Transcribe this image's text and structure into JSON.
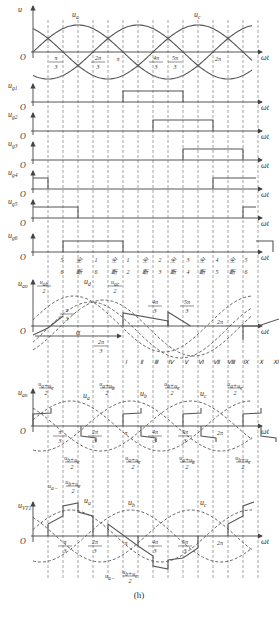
{
  "figure": {
    "caption": "(h)",
    "x_axis_label": "ωt",
    "origin_label": "O",
    "geometry": {
      "x0": 33,
      "x_end": 258,
      "px_per_pi6": 15,
      "amp": 27
    }
  },
  "vertical_dashed_lines_pi6_multiples": [
    1,
    2,
    3,
    4,
    5,
    6,
    7,
    8,
    9,
    10,
    11,
    12,
    13,
    14,
    15
  ],
  "panels": [
    {
      "id": "phase-voltages",
      "y_label": "u",
      "axis_y": 52,
      "curves": [
        {
          "name": "u_a",
          "phase_deg": 0,
          "style": "solid",
          "label": "u_a",
          "label_x": 72,
          "label_y": 17
        },
        {
          "name": "u_b",
          "phase_deg": -120,
          "style": "solid"
        },
        {
          "name": "u_c",
          "phase_deg": 120,
          "style": "solid",
          "label": "u_c",
          "label_x": 194,
          "label_y": 17
        }
      ],
      "tick_labels": [
        {
          "text_num": "π",
          "text_den": "3",
          "x": 56
        },
        {
          "text_num": "2π",
          "text_den": "3",
          "x": 98
        },
        {
          "text": "π",
          "x": 118
        },
        {
          "text_num": "4π",
          "text_den": "3",
          "x": 156
        },
        {
          "text_num": "5π",
          "text_den": "3",
          "x": 175
        },
        {
          "text": "2π",
          "x": 218
        }
      ]
    }
  ],
  "gate_pulses": [
    {
      "label": "u_g1",
      "axis_y": 102,
      "segments": [
        [
          6,
          10
        ]
      ]
    },
    {
      "label": "u_g2",
      "axis_y": 131,
      "segments": [
        [
          8,
          12
        ]
      ]
    },
    {
      "label": "u_g3",
      "axis_y": 160,
      "segments": [
        [
          10,
          14
        ]
      ]
    },
    {
      "label": "u_g4",
      "axis_y": 189,
      "segments": [
        [
          0,
          1
        ],
        [
          12,
          16
        ]
      ]
    },
    {
      "label": "u_g5",
      "axis_y": 218,
      "segments": [
        [
          0,
          3
        ],
        [
          14,
          17
        ]
      ]
    },
    {
      "label": "u_g6",
      "axis_y": 252,
      "segments": [
        [
          2,
          6
        ],
        [
          16,
          17
        ]
      ]
    }
  ],
  "conduction_row": {
    "y": 262,
    "items": [
      {
        "top": "5",
        "bottom": "6",
        "x": 62
      },
      {
        "top": "全",
        "bottom": "断",
        "x": 79
      },
      {
        "top": "1",
        "bottom": "6",
        "x": 96
      },
      {
        "top": "全",
        "bottom": "断",
        "x": 114
      },
      {
        "top": "1",
        "bottom": "2",
        "x": 128
      },
      {
        "top": "全",
        "bottom": "断",
        "x": 145
      },
      {
        "top": "2",
        "bottom": "3",
        "x": 160
      },
      {
        "top": "全",
        "bottom": "断",
        "x": 173
      },
      {
        "top": "3",
        "bottom": "4",
        "x": 188
      },
      {
        "top": "全",
        "bottom": "断",
        "x": 202
      },
      {
        "top": "4",
        "bottom": "5",
        "x": 217
      },
      {
        "top": "全",
        "bottom": "断",
        "x": 232
      },
      {
        "top": "5",
        "bottom": "6",
        "x": 246
      }
    ]
  },
  "uao_panel": {
    "y_label": "u_ao",
    "axis_y": 326,
    "labels": {
      "uab_half_num": "u_ab",
      "uab_half_den": "2",
      "ud": "u_d",
      "uac_half_num": "u_ac",
      "uac_half_den": "2",
      "alpha": "α",
      "pi3_num": "π",
      "pi3_den": "3",
      "two_pi3_num": "2π",
      "two_pi3_den": "3",
      "four_pi3_num": "4π",
      "four_pi3_den": "3",
      "five_pi3_num": "5π",
      "five_pi3_den": "3",
      "two_pi": "2π"
    },
    "intervals": [
      "Ⅰ",
      "Ⅱ",
      "Ⅲ",
      "Ⅳ",
      "Ⅴ",
      "Ⅵ",
      "Ⅶ",
      "Ⅷ",
      "Ⅸ",
      "Ⅹ",
      "Ⅺ",
      "Ⅻ"
    ]
  },
  "uan_panel": {
    "y_label": "u_an",
    "axis_y": 426,
    "top_annotations": [
      {
        "num": "u_a+u_c",
        "den": "2",
        "x": 46
      },
      {
        "num": "u_a+u_b",
        "den": "2",
        "x": 107
      },
      {
        "num": "u_b+u_c",
        "den": "2",
        "x": 172
      },
      {
        "num": "u_a+u_c",
        "den": "2",
        "x": 235
      }
    ],
    "bottom_annotations": [
      {
        "num": "u_b+u_c",
        "den": "2",
        "x": 72
      },
      {
        "num": "u_a+u_c",
        "den": "2",
        "x": 133
      },
      {
        "num": "u_a+u_b",
        "den": "2",
        "x": 187
      },
      {
        "num": "u_b+u_c",
        "den": "2",
        "x": 243
      }
    ],
    "curve_labels": [
      "u_a",
      "u_b",
      "u_c"
    ]
  },
  "uvt1_panel": {
    "y_label": "u_VT1",
    "axis_y": 536,
    "annotation_top": {
      "prefix": "u_a−",
      "num": "u_b+u_c",
      "den": "2"
    },
    "annotation_bottom": {
      "prefix": "u_a−",
      "num": "u_b+u_c",
      "den": "2"
    },
    "curve_labels": [
      "u_a",
      "u_b",
      "u_c"
    ]
  }
}
